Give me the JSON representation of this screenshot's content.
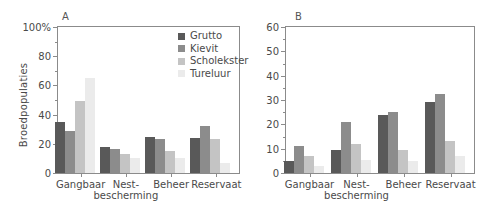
{
  "chart_data": [
    {
      "panel": "A",
      "type": "bar",
      "title": "A",
      "xlabel": "",
      "ylabel": "Broedpopulaties",
      "ylim": [
        0,
        100
      ],
      "yticks": [
        0,
        20,
        40,
        60,
        80,
        100
      ],
      "ytick_labels": [
        "0",
        "20",
        "40",
        "60",
        "80",
        "100%"
      ],
      "grid": false,
      "legend_position": "top-right",
      "categories": [
        "Gangbaar",
        "Nest-bescherming",
        "Beheer",
        "Reservaat"
      ],
      "category_lines": [
        [
          "Gangbaar"
        ],
        [
          "Nest-",
          "bescherming"
        ],
        [
          "Beheer"
        ],
        [
          "Reservaat"
        ]
      ],
      "series": [
        {
          "name": "Grutto",
          "color": "#595959",
          "values": [
            35,
            17.5,
            25,
            24
          ]
        },
        {
          "name": "Kievit",
          "color": "#8c8c8c",
          "values": [
            29,
            16.5,
            23,
            32
          ]
        },
        {
          "name": "Scholekster",
          "color": "#c4c4c4",
          "values": [
            49,
            13,
            15,
            23
          ]
        },
        {
          "name": "Tureluur",
          "color": "#ebebeb",
          "values": [
            65,
            10.5,
            10,
            7
          ]
        }
      ]
    },
    {
      "panel": "B",
      "type": "bar",
      "title": "B",
      "xlabel": "",
      "ylabel": "",
      "ylim": [
        0,
        60
      ],
      "yticks": [
        0,
        10,
        20,
        30,
        40,
        50,
        60
      ],
      "ytick_labels": [
        "0",
        "10",
        "20",
        "30",
        "40",
        "50",
        "60"
      ],
      "grid": false,
      "legend_position": "none",
      "categories": [
        "Gangbaar",
        "Nest-bescherming",
        "Beheer",
        "Reservaat"
      ],
      "category_lines": [
        [
          "Gangbaar"
        ],
        [
          "Nest-",
          "bescherming"
        ],
        [
          "Beheer"
        ],
        [
          "Reservaat"
        ]
      ],
      "series": [
        {
          "name": "Grutto",
          "color": "#595959",
          "values": [
            5,
            9.5,
            24,
            29
          ]
        },
        {
          "name": "Kievit",
          "color": "#8c8c8c",
          "values": [
            11,
            21,
            25,
            32.5
          ]
        },
        {
          "name": "Scholekster",
          "color": "#c4c4c4",
          "values": [
            7,
            12,
            9.5,
            13
          ]
        },
        {
          "name": "Tureluur",
          "color": "#ebebeb",
          "values": [
            3,
            5.5,
            5,
            7
          ]
        }
      ]
    }
  ],
  "legend": {
    "items": [
      {
        "label": "Grutto",
        "color": "#595959"
      },
      {
        "label": "Kievit",
        "color": "#8c8c8c"
      },
      {
        "label": "Scholekster",
        "color": "#c4c4c4"
      },
      {
        "label": "Tureluur",
        "color": "#ebebeb"
      }
    ]
  },
  "axis_style": {
    "line_color": "#8b8b8b",
    "text_color": "#4a4a4a"
  }
}
